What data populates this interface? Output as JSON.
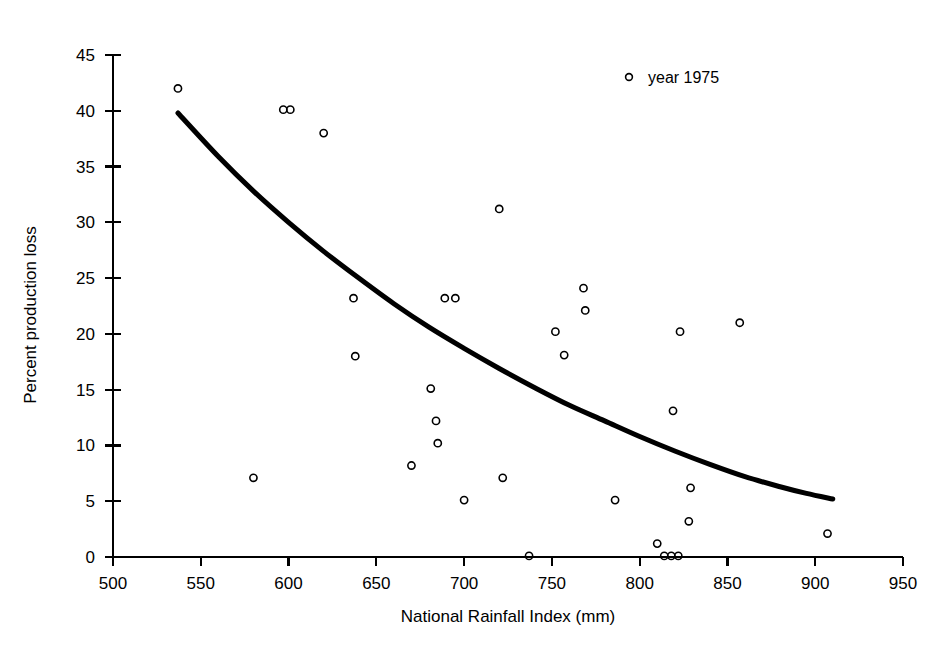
{
  "chart_data": {
    "type": "scatter",
    "title": "",
    "xlabel": "National Rainfall Index (mm)",
    "ylabel": "Percent production loss",
    "xlim": [
      500,
      950
    ],
    "ylim": [
      0,
      45
    ],
    "xticks": [
      500,
      550,
      600,
      650,
      700,
      750,
      800,
      850,
      900,
      950
    ],
    "yticks": [
      0,
      5,
      10,
      15,
      20,
      25,
      30,
      35,
      40,
      45
    ],
    "grid": false,
    "legend_position": "top-right",
    "legend": [
      "year 1975"
    ],
    "series": [
      {
        "name": "year 1975",
        "marker": "open-circle",
        "color": "#000000",
        "points": [
          [
            537,
            42.0
          ],
          [
            597,
            40.1
          ],
          [
            601,
            40.1
          ],
          [
            620,
            38.0
          ],
          [
            580,
            7.1
          ],
          [
            637,
            23.2
          ],
          [
            638,
            18.0
          ],
          [
            670,
            8.2
          ],
          [
            681,
            15.1
          ],
          [
            684,
            12.2
          ],
          [
            685,
            10.2
          ],
          [
            689,
            23.2
          ],
          [
            695,
            23.2
          ],
          [
            700,
            5.1
          ],
          [
            720,
            31.2
          ],
          [
            722,
            7.1
          ],
          [
            737,
            0.1
          ],
          [
            752,
            20.2
          ],
          [
            757,
            18.1
          ],
          [
            768,
            24.1
          ],
          [
            769,
            22.1
          ],
          [
            786,
            5.1
          ],
          [
            810,
            1.2
          ],
          [
            814,
            0.1
          ],
          [
            818,
            0.1
          ],
          [
            819,
            13.1
          ],
          [
            822,
            0.1
          ],
          [
            823,
            20.2
          ],
          [
            828,
            3.2
          ],
          [
            829,
            6.2
          ],
          [
            857,
            21.0
          ],
          [
            907,
            2.1
          ]
        ]
      }
    ],
    "trend_curve": {
      "name": "exponential-fit",
      "style": "solid-thick",
      "color": "#000000",
      "points": [
        [
          537,
          39.8
        ],
        [
          560,
          35.9
        ],
        [
          580,
          32.8
        ],
        [
          600,
          30.0
        ],
        [
          620,
          27.4
        ],
        [
          640,
          25.0
        ],
        [
          660,
          22.7
        ],
        [
          680,
          20.6
        ],
        [
          700,
          18.7
        ],
        [
          720,
          16.9
        ],
        [
          740,
          15.2
        ],
        [
          760,
          13.6
        ],
        [
          780,
          12.2
        ],
        [
          800,
          10.8
        ],
        [
          820,
          9.5
        ],
        [
          840,
          8.3
        ],
        [
          860,
          7.2
        ],
        [
          880,
          6.3
        ],
        [
          895,
          5.7
        ],
        [
          910,
          5.2
        ]
      ]
    }
  },
  "legend": {
    "entries": [
      {
        "label": "year 1975",
        "marker": "open-circle"
      }
    ]
  },
  "axes": {
    "x_title": "National Rainfall Index (mm)",
    "y_title": "Percent production loss",
    "x_tick_labels": [
      "500",
      "550",
      "600",
      "650",
      "700",
      "750",
      "800",
      "850",
      "900",
      "950"
    ],
    "y_tick_labels": [
      "0",
      "5",
      "10",
      "15",
      "20",
      "25",
      "30",
      "35",
      "40",
      "45"
    ]
  }
}
